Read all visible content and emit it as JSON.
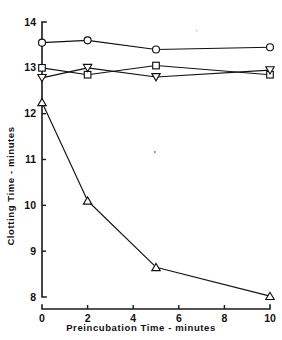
{
  "chart_data": {
    "type": "line",
    "title": "",
    "subtitle": "",
    "xlabel": "Preincubation  Time - minutes",
    "ylabel": "Clotting  Time - minutes",
    "xlim": [
      0,
      10
    ],
    "ylim": [
      8,
      14
    ],
    "x": [
      0,
      2,
      5,
      10
    ],
    "xticks": [
      0,
      2,
      4,
      6,
      8,
      10
    ],
    "xtick_labels": [
      "0",
      "2",
      "4",
      "6",
      "8",
      "10"
    ],
    "yticks": [
      8,
      9,
      10,
      11,
      12,
      13,
      14
    ],
    "ytick_labels": [
      "8",
      "9",
      "10",
      "11",
      "12",
      "13",
      "14"
    ],
    "grid": false,
    "legend": "none",
    "series": [
      {
        "name": "circle-series",
        "marker": "circle-open",
        "color": "#111111",
        "values": [
          13.55,
          13.6,
          13.4,
          13.45
        ]
      },
      {
        "name": "square-series",
        "marker": "square-open",
        "color": "#111111",
        "values": [
          13.0,
          12.85,
          13.05,
          12.85
        ]
      },
      {
        "name": "inverted-triangle-series",
        "marker": "triangle-down-open",
        "color": "#111111",
        "values": [
          12.78,
          13.0,
          12.8,
          12.95
        ]
      },
      {
        "name": "triangle-series",
        "marker": "triangle-up-open",
        "color": "#111111",
        "values": [
          12.25,
          10.1,
          8.65,
          8.02
        ]
      }
    ]
  }
}
